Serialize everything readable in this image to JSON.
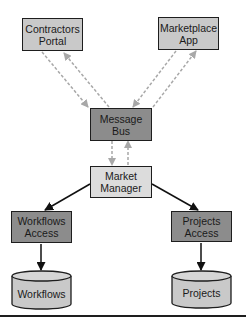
{
  "diagram": {
    "nodes": [
      {
        "id": "contractors_portal",
        "label_line1": "Contractors",
        "label_line2": "Portal",
        "shape": "rect",
        "fill": "#c9c9c9"
      },
      {
        "id": "marketplace_app",
        "label_line1": "Marketplace",
        "label_line2": "App",
        "shape": "rect",
        "fill": "#c9c9c9"
      },
      {
        "id": "message_bus",
        "label_line1": "Message",
        "label_line2": "Bus",
        "shape": "rect",
        "fill": "#8c8c8c"
      },
      {
        "id": "market_manager",
        "label_line1": "Market",
        "label_line2": "Manager",
        "shape": "rect",
        "fill": "#dcdcdc"
      },
      {
        "id": "workflows_access",
        "label_line1": "Workflows",
        "label_line2": "Access",
        "shape": "rect",
        "fill": "#8c8c8c"
      },
      {
        "id": "projects_access",
        "label_line1": "Projects",
        "label_line2": "Access",
        "shape": "rect",
        "fill": "#8c8c8c"
      },
      {
        "id": "workflows_db",
        "label": "Workflows",
        "shape": "cylinder",
        "fill": "#c9c9c9"
      },
      {
        "id": "projects_db",
        "label": "Projects",
        "shape": "cylinder",
        "fill": "#c9c9c9"
      }
    ],
    "edges": [
      {
        "from": "contractors_portal",
        "to": "message_bus",
        "style": "dashed"
      },
      {
        "from": "message_bus",
        "to": "contractors_portal",
        "style": "dashed"
      },
      {
        "from": "marketplace_app",
        "to": "message_bus",
        "style": "dashed"
      },
      {
        "from": "message_bus",
        "to": "marketplace_app",
        "style": "dashed"
      },
      {
        "from": "message_bus",
        "to": "market_manager",
        "style": "dashed"
      },
      {
        "from": "market_manager",
        "to": "message_bus",
        "style": "dashed"
      },
      {
        "from": "market_manager",
        "to": "workflows_access",
        "style": "solid"
      },
      {
        "from": "market_manager",
        "to": "projects_access",
        "style": "solid"
      },
      {
        "from": "workflows_access",
        "to": "workflows_db",
        "style": "solid"
      },
      {
        "from": "projects_access",
        "to": "projects_db",
        "style": "solid"
      }
    ]
  }
}
